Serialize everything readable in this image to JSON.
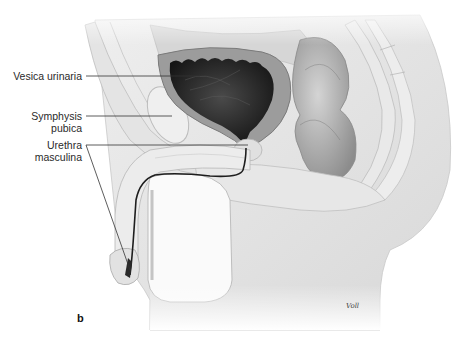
{
  "figure": {
    "panel_letter": "b",
    "signature": "Voll",
    "labels": [
      {
        "id": "vesica",
        "text": "Vesica urinaria"
      },
      {
        "id": "symphysis",
        "lines": [
          "Symphysis",
          "pubica"
        ]
      },
      {
        "id": "urethra",
        "lines": [
          "Urethra",
          "masculina"
        ]
      }
    ],
    "colors": {
      "background": "#ffffff",
      "tissue_light": "#e6e6e6",
      "tissue_mid": "#cfcfcf",
      "bladder_wall": "#9a9a9a",
      "bladder_lumen": "#2a2a2a",
      "urethra_line": "#1e1e1e",
      "leader_line": "#333333",
      "label_text": "#2a2a2a"
    }
  }
}
